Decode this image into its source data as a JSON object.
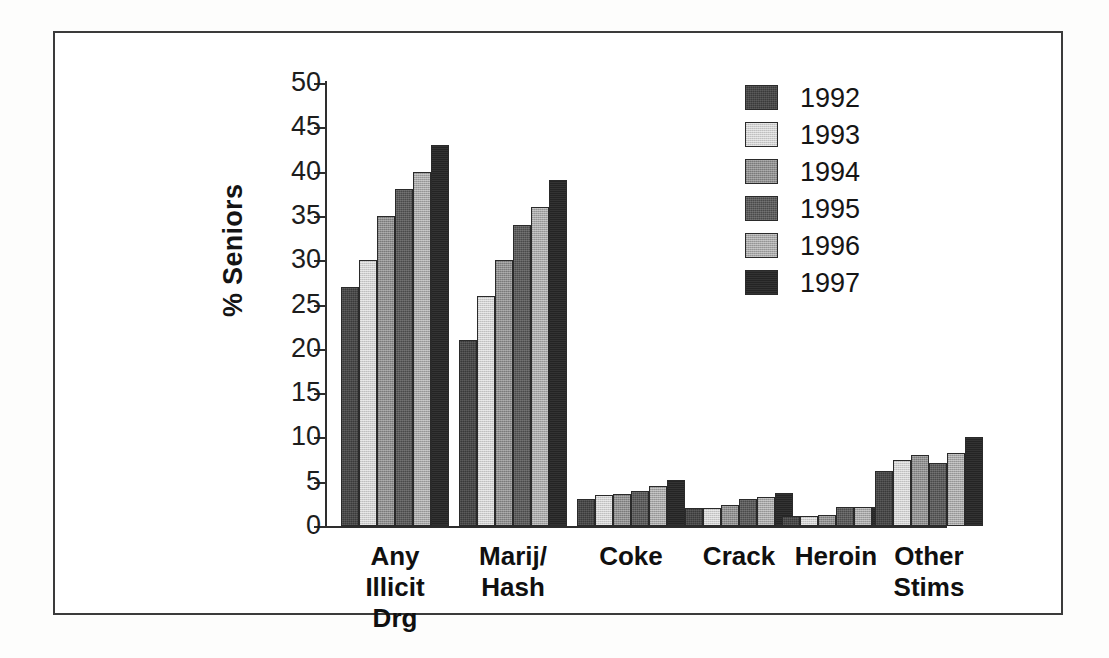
{
  "chart_data": {
    "type": "bar",
    "title": "",
    "xlabel": "",
    "ylabel": "% Seniors",
    "ylim": [
      0,
      50
    ],
    "yticks": [
      0,
      5,
      10,
      15,
      20,
      25,
      30,
      35,
      40,
      45,
      50
    ],
    "ytick_labels": [
      "0",
      "5",
      "10",
      "15",
      "20",
      "25",
      "30",
      "35",
      "40",
      "45",
      "50"
    ],
    "grid": false,
    "legend_position": "top-right",
    "categories": [
      "Any\nIllicit\nDrg",
      "Marij/\nHash",
      "Coke",
      "Crack",
      "Heroin",
      "Other\nStims"
    ],
    "series": [
      {
        "name": "1992",
        "color": "#3a3a3a",
        "values": [
          27,
          21,
          3.1,
          2.0,
          1.1,
          6.2
        ]
      },
      {
        "name": "1993",
        "color": "#cfcfcf",
        "values": [
          30,
          26,
          3.5,
          2.0,
          1.1,
          7.5
        ]
      },
      {
        "name": "1994",
        "color": "#8e8e8e",
        "values": [
          35,
          30,
          3.6,
          2.4,
          1.2,
          8.0
        ]
      },
      {
        "name": "1995",
        "color": "#4a4a4a",
        "values": [
          38,
          34,
          4.0,
          3.0,
          2.1,
          7.1
        ]
      },
      {
        "name": "1996",
        "color": "#a6a6a6",
        "values": [
          40,
          36,
          4.5,
          3.3,
          2.1,
          8.2
        ]
      },
      {
        "name": "1997",
        "color": "#242424",
        "values": [
          43,
          39,
          5.2,
          3.7,
          2.1,
          10.1
        ]
      }
    ]
  },
  "legend": {
    "entries": [
      "1992",
      "1993",
      "1994",
      "1995",
      "1996",
      "1997"
    ]
  },
  "axis": {
    "y_label": "% Seniors"
  }
}
